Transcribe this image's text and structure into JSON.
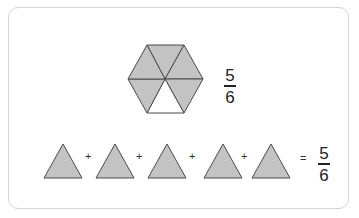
{
  "hexagon": {
    "total_parts": 6,
    "shaded_parts": 5,
    "fill_color": "#c3c3c3",
    "empty_color": "#ffffff",
    "stroke_color": "#4a4a4a"
  },
  "hexagon_fraction": {
    "numerator": "5",
    "denominator": "6"
  },
  "equation": {
    "triangle_count": 5,
    "operator_plus": "+",
    "operator_equals": "=",
    "result": {
      "numerator": "5",
      "denominator": "6"
    }
  }
}
